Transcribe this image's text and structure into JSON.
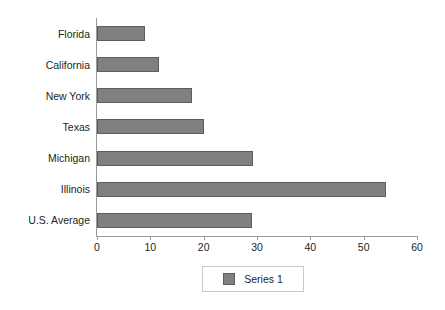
{
  "chart_data": {
    "type": "bar",
    "orientation": "horizontal",
    "title": "",
    "subtitle": "",
    "xlabel": "",
    "ylabel": "",
    "categories": [
      "Florida",
      "California",
      "New York",
      "Texas",
      "Michigan",
      "Illinois",
      "U.S. Average"
    ],
    "series": [
      {
        "name": "Series 1",
        "values": [
          9,
          11.6,
          17.8,
          20,
          29.3,
          54.2,
          29
        ]
      }
    ],
    "xlim": [
      0,
      60
    ],
    "xticks": [
      0,
      10,
      20,
      30,
      40,
      50,
      60
    ],
    "xtick_labels": [
      "0",
      "10",
      "20",
      "30",
      "40",
      "50",
      "60"
    ],
    "grid": false,
    "legend_position": "bottom-center",
    "legend_entries": [
      "Series 1"
    ],
    "bar_color": "#808080",
    "bar_edge_color": "#5d5d5d",
    "axis_color": "#9a9a9a",
    "background_color": "#ffffff",
    "text_color": "#231f20"
  },
  "legend": {
    "series_1_label": "Series 1"
  }
}
